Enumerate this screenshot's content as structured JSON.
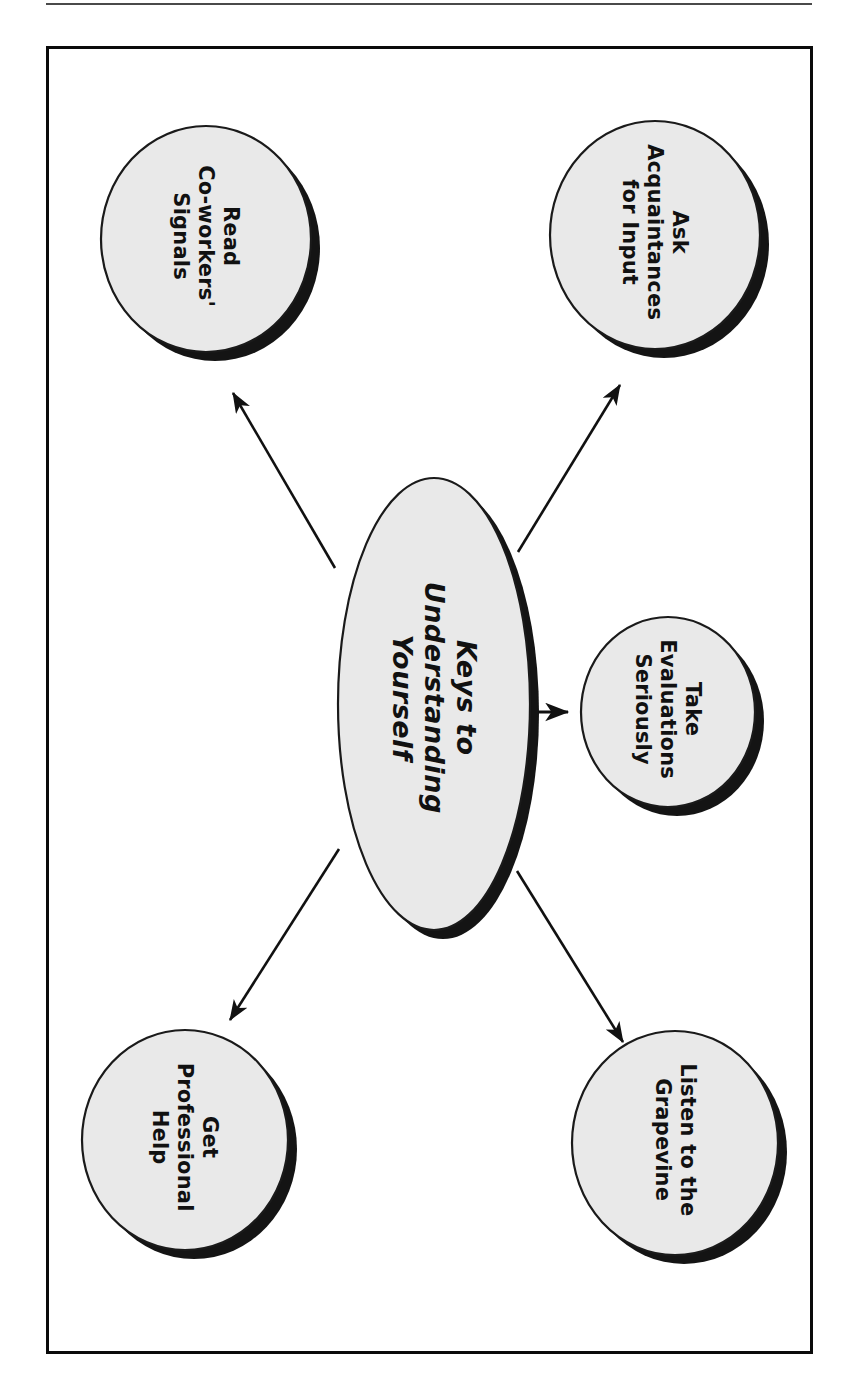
{
  "figure": {
    "kind": "concept-map",
    "orientation": "rotated-90-clockwise",
    "frame_color": "#0a0a0a",
    "node_fill": "#e9e9e9",
    "node_stroke": "#1a1a1a",
    "shadow_color": "#141414",
    "arrow_color": "#111111"
  },
  "center": {
    "id": "keys-to-understanding-yourself",
    "label": "Keys to\nUnderstanding\nYourself",
    "line1": "Keys to",
    "line2": "Understanding",
    "line3": "Yourself"
  },
  "nodes": [
    {
      "id": "read-co-workers-signals",
      "label": "Read\nCo-workers'\nSignals",
      "line1": "Read",
      "line2": "Co-workers'",
      "line3": "Signals",
      "position": "top-left"
    },
    {
      "id": "ask-acquaintances-for-input",
      "label": "Ask\nAcquaintances\nfor Input",
      "line1": "Ask",
      "line2": "Acquaintances",
      "line3": "for Input",
      "position": "top-right"
    },
    {
      "id": "take-evaluations-seriously",
      "label": "Take\nEvaluations\nSeriously",
      "line1": "Take",
      "line2": "Evaluations",
      "line3": "Seriously",
      "position": "middle-right"
    },
    {
      "id": "get-professional-help",
      "label": "Get\nProfessional\nHelp",
      "line1": "Get",
      "line2": "Professional",
      "line3": "Help",
      "position": "bottom-left"
    },
    {
      "id": "listen-to-the-grapevine",
      "label": "Listen to the\nGrapevine",
      "line1": "Listen to the",
      "line2": "Grapevine",
      "line3": "",
      "position": "bottom-right"
    }
  ],
  "connections": [
    {
      "from": "keys-to-understanding-yourself",
      "to": "read-co-workers-signals"
    },
    {
      "from": "keys-to-understanding-yourself",
      "to": "ask-acquaintances-for-input"
    },
    {
      "from": "keys-to-understanding-yourself",
      "to": "take-evaluations-seriously"
    },
    {
      "from": "keys-to-understanding-yourself",
      "to": "get-professional-help"
    },
    {
      "from": "keys-to-understanding-yourself",
      "to": "listen-to-the-grapevine"
    }
  ]
}
